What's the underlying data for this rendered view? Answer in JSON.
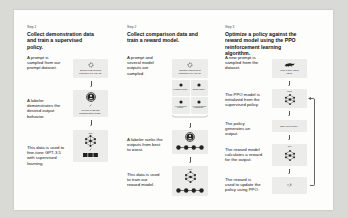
{
  "diagram": {
    "colors": {
      "background": "#d9d9d6",
      "panel": "#fdfdfc",
      "box": "#ececea",
      "icon_dark": "#222222",
      "arrow": "#555555"
    },
    "steps": [
      {
        "label": "Step 1",
        "title": "Collect demonstration data and train a supervised policy.",
        "rows": [
          {
            "text": "A prompt is sampled from our prompt dataset.",
            "box_caption": "Explain reinforcement learning to a 6 year old.",
            "icon": "prompt-icon"
          },
          {
            "text": "A labeler demonstrates the desired output behavior.",
            "box_caption": "We give treats and punishments to teach...",
            "icon": "labeler-icon"
          },
          {
            "text": "This data is used to fine-tune GPT-3.5 with supervised learning.",
            "box_label": "SFT",
            "icon": "neural-network-icon"
          }
        ]
      },
      {
        "label": "Step 2",
        "title": "Collect comparison data and train a reward model.",
        "rows": [
          {
            "text": "A prompt and several model outputs are sampled.",
            "box_caption": "Explain reinforcement learning to a 6 year old.",
            "outputs": [
              "In machine learning...",
              "Explain rewards...",
              "In reinforcement learning...",
              "We give treats and punishments..."
            ],
            "icon": "prompt-icon"
          },
          {
            "text": "A labeler ranks the outputs from best to worst.",
            "icon": "labeler-icon",
            "ranking": "D > C > A > B"
          },
          {
            "text": "This data is used to train our reward model.",
            "box_label": "RM",
            "icon": "neural-network-icon",
            "ranking": "D > C > A > B"
          }
        ]
      },
      {
        "label": "Step 3",
        "title": "Optimize a policy against the reward model using the PPO reinforcement learning algorithm.",
        "rows": [
          {
            "text": "A new prompt is sampled from the dataset.",
            "box_caption": "Write a story about otters.",
            "icon": "otter-icon"
          },
          {
            "text": "The PPO model is initialized from the supervised policy.",
            "box_label": "PPO",
            "icon": "neural-network-icon"
          },
          {
            "text": "The policy generates an output.",
            "box_caption": "Once upon a time..."
          },
          {
            "text": "The reward model calculates a reward for the output.",
            "box_label": "RM",
            "icon": "neural-network-icon"
          },
          {
            "text": "The reward is used to update the policy using PPO.",
            "box_caption": "r_k"
          }
        ]
      }
    ]
  }
}
